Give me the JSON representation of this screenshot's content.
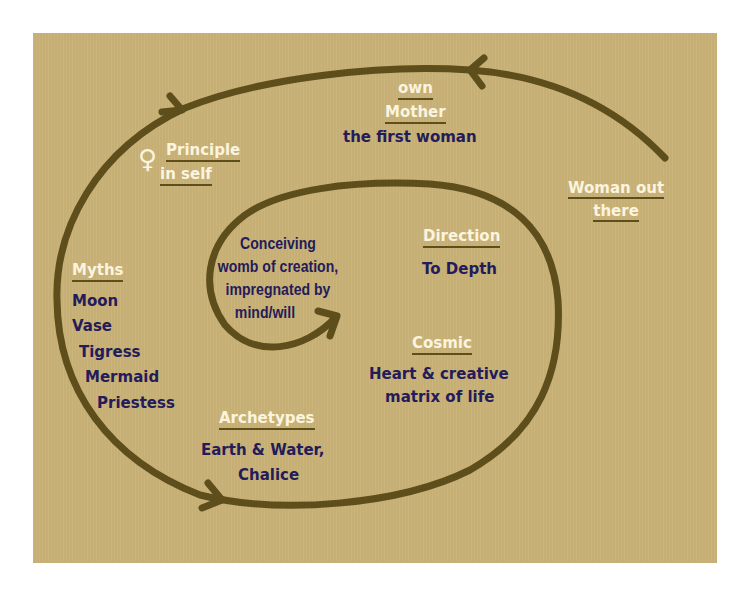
{
  "diagram": {
    "colors": {
      "background": "#c9b277",
      "spiral": "#5e4e1c",
      "heading_text": "#fbf4de",
      "body_text": "#241b5a"
    },
    "spiral_direction": "inward, counter-clockwise with arrowheads",
    "sections": {
      "outer": {
        "heading": "Woman out there"
      },
      "mother": {
        "heading_line1": "own",
        "heading_line2": "Mother",
        "body": "the first woman"
      },
      "principle": {
        "icon": "venus-symbol",
        "icon_glyph": "♀",
        "heading_line1": "Principle",
        "heading_line2": "in self"
      },
      "myths": {
        "heading": "Myths",
        "items": [
          "Moon",
          "Vase",
          "Tigress",
          "Mermaid",
          "Priestess"
        ]
      },
      "archetypes": {
        "heading": "Archetypes",
        "body_line1": "Earth & Water,",
        "body_line2": "Chalice"
      },
      "cosmic": {
        "heading": "Cosmic",
        "body_line1": "Heart & creative",
        "body_line2": "matrix of life"
      },
      "direction": {
        "heading": "Direction",
        "body": "To Depth"
      },
      "center": {
        "line1": "Conceiving",
        "line2": "womb of creation,",
        "line3": "impregnated by",
        "line4": "mind/will"
      }
    }
  }
}
